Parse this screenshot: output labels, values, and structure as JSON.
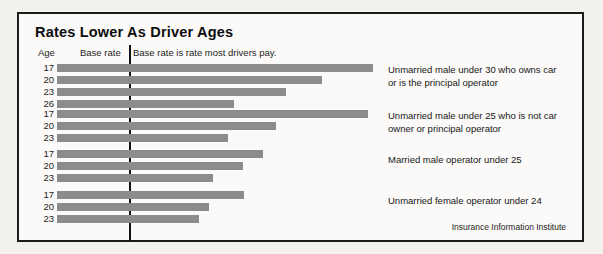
{
  "chart_data": {
    "type": "bar",
    "title": "Rates Lower As Driver Ages",
    "orientation": "horizontal",
    "xlabel": "",
    "ylabel": "Age",
    "grid": false,
    "legend_position": "right",
    "note": "Base rate is rate most drivers pay.",
    "reference_line_label": "Base rate",
    "reference_line_value": 100,
    "xlim": [
      0,
      330
    ],
    "source": "Insurance Information Institute",
    "columns": [
      "Age",
      "Base rate"
    ],
    "series": [
      {
        "name": "Unmarried male under 30 who owns car\nor is the principal operator",
        "categories": [
          "17",
          "20",
          "23",
          "26"
        ],
        "values": [
          292,
          245,
          212,
          164
        ]
      },
      {
        "name": "Unmarried male under 25 who is not car\nowner or principal operator",
        "categories": [
          "17",
          "20",
          "23"
        ],
        "values": [
          288,
          203,
          158
        ]
      },
      {
        "name": "Married male operator under 25",
        "categories": [
          "17",
          "20",
          "23"
        ],
        "values": [
          191,
          172,
          144
        ]
      },
      {
        "name": "Unmarried female operator under 24",
        "categories": [
          "17",
          "20",
          "23"
        ],
        "values": [
          173,
          141,
          131
        ]
      }
    ]
  },
  "chart": {
    "title": "Rates Lower As Driver Ages",
    "header": {
      "age": "Age",
      "base_rate": "Base rate",
      "note": "Base rate is rate most drivers pay."
    },
    "source": "Insurance Information Institute",
    "colors": {
      "bar": "#8c8c8c",
      "frame": "#1b1b1b",
      "baseline": "#121212",
      "text": "#1d1d1d"
    },
    "groups": [
      {
        "label": "Unmarried male under 30 who owns car\nor is the principal operator",
        "rows": [
          {
            "age": "17",
            "value": 292
          },
          {
            "age": "20",
            "value": 245
          },
          {
            "age": "23",
            "value": 212
          },
          {
            "age": "26",
            "value": 164
          }
        ]
      },
      {
        "label": "Unmarried male under 25 who is not car\nowner or principal operator",
        "rows": [
          {
            "age": "17",
            "value": 288
          },
          {
            "age": "20",
            "value": 203
          },
          {
            "age": "23",
            "value": 158
          }
        ]
      },
      {
        "label": "Married male operator under 25",
        "rows": [
          {
            "age": "17",
            "value": 191
          },
          {
            "age": "20",
            "value": 172
          },
          {
            "age": "23",
            "value": 144
          }
        ]
      },
      {
        "label": "Unmarried female operator under 24",
        "rows": [
          {
            "age": "17",
            "value": 173
          },
          {
            "age": "20",
            "value": 141
          },
          {
            "age": "23",
            "value": 131
          }
        ]
      }
    ]
  }
}
